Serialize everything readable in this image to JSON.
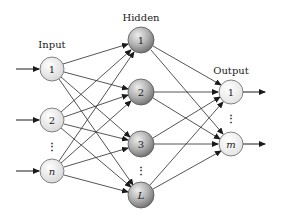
{
  "colors": {
    "edge": "#2a2a2a",
    "input_fill_light": "#ffffff",
    "input_fill_dark": "#d9d9d9",
    "hidden_fill_light": "#e6e6e6",
    "hidden_fill_dark": "#7a7a7a",
    "output_fill": "#f2f2f2",
    "stroke": "#555555"
  },
  "layers": {
    "input": {
      "label": "Input",
      "nodes": [
        {
          "label": "1",
          "italic": false
        },
        {
          "label": "2",
          "italic": false
        },
        {
          "label": "n",
          "italic": true
        }
      ]
    },
    "hidden": {
      "label": "Hidden",
      "nodes": [
        {
          "label": "1",
          "italic": false
        },
        {
          "label": "2",
          "italic": false
        },
        {
          "label": "3",
          "italic": false
        },
        {
          "label": "L",
          "italic": true
        }
      ]
    },
    "output": {
      "label": "Output",
      "nodes": [
        {
          "label": "1",
          "italic": false
        },
        {
          "label": "m",
          "italic": true
        }
      ]
    }
  },
  "ellipsis": "⋮"
}
